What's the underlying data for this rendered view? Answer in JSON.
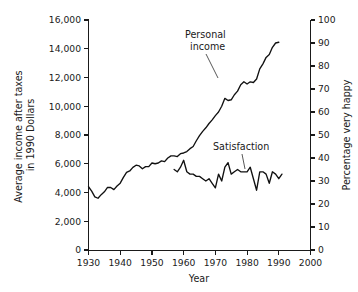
{
  "chart_data": {
    "type": "line",
    "title": "",
    "xlabel": "Year",
    "ylabel": "Average income after taxes in 1990 Dollars",
    "y2label": "Percentage very happy",
    "xlim": [
      1930,
      2000
    ],
    "ylim": [
      0,
      16000
    ],
    "y2lim": [
      0,
      100
    ],
    "grid": false,
    "legend": "inline-annotations",
    "xticks": [
      1930,
      1940,
      1950,
      1960,
      1970,
      1980,
      1990,
      2000
    ],
    "xtick_labels": [
      "1930",
      "1940",
      "1950",
      "1960",
      "1970",
      "1980",
      "1990",
      "2000"
    ],
    "yticks": [
      0,
      2000,
      4000,
      6000,
      8000,
      10000,
      12000,
      14000,
      16000
    ],
    "ytick_labels": [
      "0",
      "2,000",
      "4,000",
      "6,000",
      "8,000",
      "10,000",
      "12,000",
      "14,000",
      "16,000"
    ],
    "y2ticks": [
      0,
      10,
      20,
      30,
      40,
      50,
      60,
      70,
      80,
      90,
      100
    ],
    "y2tick_labels": [
      "0",
      "10",
      "20",
      "30",
      "40",
      "50",
      "60",
      "70",
      "80",
      "90",
      "100"
    ],
    "annotations": [
      {
        "text": "Personal income",
        "lines": [
          "Personal",
          "income"
        ],
        "target_year": 1972,
        "target_value": 10400
      },
      {
        "text": "Satisfaction",
        "lines": [
          "Satisfaction"
        ],
        "target_year": 1978,
        "target_value": 36
      }
    ],
    "series": [
      {
        "name": "Personal income",
        "axis": "left",
        "units": "1990 dollars",
        "x": [
          1930,
          1931,
          1932,
          1933,
          1934,
          1935,
          1936,
          1937,
          1938,
          1939,
          1940,
          1941,
          1942,
          1943,
          1944,
          1945,
          1946,
          1947,
          1948,
          1949,
          1950,
          1951,
          1952,
          1953,
          1954,
          1955,
          1956,
          1957,
          1958,
          1959,
          1960,
          1961,
          1962,
          1963,
          1964,
          1965,
          1966,
          1967,
          1968,
          1969,
          1970,
          1971,
          1972,
          1973,
          1974,
          1975,
          1976,
          1977,
          1978,
          1979,
          1980,
          1981,
          1982,
          1983,
          1984,
          1985,
          1986,
          1987,
          1988,
          1989,
          1990
        ],
        "y": [
          4400,
          4100,
          3700,
          3600,
          3850,
          4050,
          4350,
          4350,
          4200,
          4450,
          4650,
          5050,
          5400,
          5500,
          5750,
          5900,
          5850,
          5650,
          5800,
          5800,
          6050,
          6000,
          6050,
          6200,
          6150,
          6400,
          6550,
          6550,
          6500,
          6700,
          6750,
          6850,
          7050,
          7200,
          7600,
          7950,
          8250,
          8500,
          8800,
          9050,
          9350,
          9600,
          10000,
          10550,
          10400,
          10450,
          10800,
          11050,
          11500,
          11700,
          11550,
          11700,
          11650,
          11900,
          12600,
          12950,
          13400,
          13600,
          14100,
          14400,
          14450
        ],
        "note": "Rises from about 4,400 in 1930, dips to about 3,600 in 1933, then climbs steadily to about 15,800 by 1990"
      },
      {
        "name": "Satisfaction",
        "axis": "right",
        "units": "percentage very happy",
        "x": [
          1957,
          1958,
          1959,
          1960,
          1961,
          1962,
          1963,
          1964,
          1965,
          1966,
          1967,
          1968,
          1969,
          1970,
          1971,
          1972,
          1973,
          1974,
          1975,
          1976,
          1977,
          1978,
          1979,
          1980,
          1981,
          1982,
          1983,
          1984,
          1985,
          1986,
          1987,
          1988,
          1989,
          1990,
          1991
        ],
        "y": [
          35,
          34,
          36,
          39,
          34,
          33,
          33,
          32,
          32,
          31,
          30,
          31,
          29,
          27,
          33,
          30,
          36,
          38,
          33,
          34,
          35,
          34,
          34,
          34,
          36,
          31,
          26,
          34,
          34,
          33,
          29,
          34,
          33,
          31,
          33
        ],
        "note": "Fluctuates between about 26 and 39 percent from the late 1950s through 1991, with no upward trend"
      }
    ]
  }
}
